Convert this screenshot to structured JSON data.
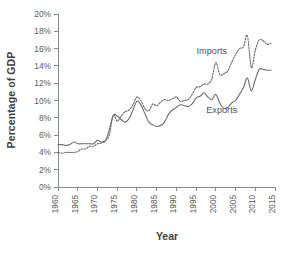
{
  "chart_data": {
    "type": "line",
    "title": "",
    "xlabel": "Year",
    "ylabel": "Percentage of GDP",
    "xlim": [
      1960,
      2015
    ],
    "ylim": [
      0,
      20
    ],
    "grid": false,
    "legend_position": "inline-annotation",
    "y_tick_labels": [
      "0%",
      "2%",
      "4%",
      "6%",
      "8%",
      "10%",
      "12%",
      "14%",
      "16%",
      "18%",
      "20%"
    ],
    "y_tick_values": [
      0,
      2,
      4,
      6,
      8,
      10,
      12,
      14,
      16,
      18,
      20
    ],
    "x_tick_labels": [
      "1960",
      "1965",
      "1970",
      "1975",
      "1980",
      "1985",
      "1990",
      "1995",
      "2000",
      "2005",
      "2010",
      "2015"
    ],
    "x_tick_values": [
      1960,
      1965,
      1970,
      1975,
      1980,
      1985,
      1990,
      1995,
      2000,
      2005,
      2010,
      2015
    ],
    "annotations": [
      {
        "text": "Imports",
        "x": 1999.0,
        "y": 15.4
      },
      {
        "text": "Exports",
        "x": 2001.5,
        "y": 8.6
      }
    ],
    "series": [
      {
        "name": "Imports",
        "style": "dotted",
        "color": "#6b6b6b",
        "x": [
          1960,
          1961,
          1962,
          1963,
          1964,
          1965,
          1966,
          1967,
          1968,
          1969,
          1970,
          1971,
          1972,
          1973,
          1974,
          1975,
          1976,
          1977,
          1978,
          1979,
          1980,
          1981,
          1982,
          1983,
          1984,
          1985,
          1986,
          1987,
          1988,
          1989,
          1990,
          1991,
          1992,
          1993,
          1994,
          1995,
          1996,
          1997,
          1998,
          1999,
          2000,
          2001,
          2002,
          2003,
          2004,
          2005,
          2006,
          2007,
          2008,
          2009,
          2010,
          2011,
          2012,
          2013,
          2014
        ],
        "values": [
          4.0,
          3.9,
          4.0,
          4.0,
          4.0,
          4.1,
          4.4,
          4.4,
          4.7,
          4.7,
          5.0,
          5.1,
          5.4,
          6.0,
          8.3,
          7.6,
          8.2,
          8.7,
          8.9,
          9.5,
          10.4,
          10.0,
          9.1,
          8.8,
          9.6,
          9.4,
          9.8,
          10.1,
          10.0,
          10.2,
          10.4,
          9.9,
          10.0,
          10.1,
          10.7,
          11.5,
          11.6,
          11.9,
          11.9,
          12.5,
          14.4,
          13.0,
          13.1,
          13.4,
          14.4,
          15.3,
          16.0,
          16.2,
          17.5,
          13.8,
          15.8,
          17.0,
          16.9,
          16.5,
          16.6
        ]
      },
      {
        "name": "Exports",
        "style": "solid",
        "color": "#6b6b6b",
        "x": [
          1960,
          1961,
          1962,
          1963,
          1964,
          1965,
          1966,
          1967,
          1968,
          1969,
          1970,
          1971,
          1972,
          1973,
          1974,
          1975,
          1976,
          1977,
          1978,
          1979,
          1980,
          1981,
          1982,
          1983,
          1984,
          1985,
          1986,
          1987,
          1988,
          1989,
          1990,
          1991,
          1992,
          1993,
          1994,
          1995,
          1996,
          1997,
          1998,
          1999,
          2000,
          2001,
          2002,
          2003,
          2004,
          2005,
          2006,
          2007,
          2008,
          2009,
          2010,
          2011,
          2012,
          2013,
          2014
        ],
        "values": [
          4.9,
          4.9,
          4.8,
          4.9,
          5.2,
          5.0,
          5.0,
          5.0,
          5.0,
          5.0,
          5.4,
          5.2,
          5.3,
          6.6,
          8.3,
          8.2,
          7.8,
          7.5,
          7.9,
          8.9,
          9.9,
          9.5,
          8.5,
          7.5,
          7.2,
          7.0,
          7.1,
          7.5,
          8.4,
          8.9,
          9.2,
          9.5,
          9.4,
          9.3,
          9.6,
          10.3,
          10.5,
          10.9,
          10.4,
          10.1,
          10.7,
          9.7,
          9.1,
          9.2,
          9.7,
          10.0,
          10.7,
          11.5,
          12.6,
          11.1,
          12.4,
          13.6,
          13.6,
          13.5,
          13.5
        ]
      }
    ]
  }
}
